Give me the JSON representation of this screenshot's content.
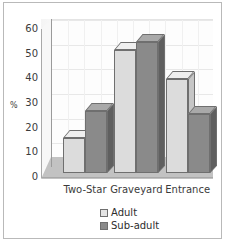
{
  "chart_data": {
    "type": "bar",
    "title": "",
    "subtitle": "",
    "xlabel": "",
    "ylabel": "%",
    "categories": [
      "Two-Star",
      "Graveyard",
      "Entrance"
    ],
    "series": [
      {
        "name": "Adult",
        "values": [
          14,
          50,
          38
        ],
        "color": "#dcdcdc"
      },
      {
        "name": "Sub-adult",
        "values": [
          25,
          53,
          24
        ],
        "color": "#8a8a8a"
      }
    ],
    "ylim": [
      0,
      60
    ],
    "yticks": [
      60,
      50,
      40,
      30,
      20,
      10,
      0
    ],
    "grid": true,
    "three_d": true,
    "legend_position": "bottom",
    "legend": [
      {
        "label": "Adult",
        "swatch": "light-gray"
      },
      {
        "label": "Sub-adult",
        "swatch": "dark-gray"
      }
    ]
  },
  "colors": {
    "frame_border": "#b9b9b9",
    "plot_background": "#fdfdfd",
    "floor": "#c2c2c2",
    "gridline": "#e8e8e8",
    "adult_bar": "#dcdcdc",
    "subadult_bar": "#8a8a8a",
    "text": "#3b3b3b"
  }
}
